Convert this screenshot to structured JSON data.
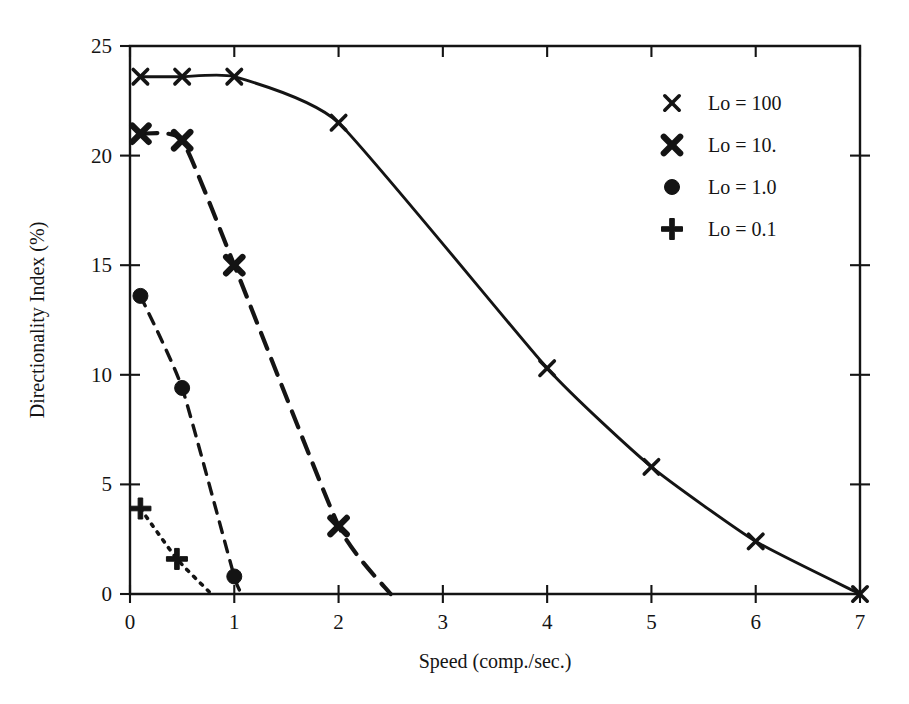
{
  "chart_data": {
    "type": "line",
    "title": "",
    "xlabel": "Speed (comp./sec.)",
    "ylabel": "Directionality Index (%)",
    "xlim": [
      0,
      7
    ],
    "ylim": [
      0,
      25
    ],
    "xticks": [
      "0",
      "1",
      "2",
      "3",
      "4",
      "5",
      "6",
      "7"
    ],
    "yticks": [
      "0",
      "5",
      "10",
      "15",
      "20",
      "25"
    ],
    "xtick_values": [
      0,
      1,
      2,
      3,
      4,
      5,
      6,
      7
    ],
    "ytick_values": [
      0,
      5,
      10,
      15,
      20,
      25
    ],
    "grid": false,
    "legend_position": "upper-right-inside",
    "frame": "box",
    "series": [
      {
        "name": "Lo = 100",
        "marker": "x-thin",
        "linestyle": "solid",
        "points": [
          {
            "x": 0.1,
            "y": 23.6
          },
          {
            "x": 0.5,
            "y": 23.6
          },
          {
            "x": 1.0,
            "y": 23.6
          },
          {
            "x": 2.0,
            "y": 21.5
          },
          {
            "x": 4.0,
            "y": 10.3
          },
          {
            "x": 5.0,
            "y": 5.8
          },
          {
            "x": 6.0,
            "y": 2.4
          },
          {
            "x": 7.0,
            "y": 0.0
          }
        ]
      },
      {
        "name": "Lo = 10.",
        "marker": "x-bold",
        "linestyle": "long-dash",
        "points": [
          {
            "x": 0.1,
            "y": 21.0
          },
          {
            "x": 0.5,
            "y": 20.7
          },
          {
            "x": 1.0,
            "y": 15.0
          },
          {
            "x": 2.0,
            "y": 3.1
          },
          {
            "x": 2.5,
            "y": 0.0
          }
        ]
      },
      {
        "name": "Lo = 1.0",
        "marker": "circle",
        "linestyle": "medium-dash",
        "points": [
          {
            "x": 0.1,
            "y": 13.6
          },
          {
            "x": 0.5,
            "y": 9.4
          },
          {
            "x": 1.0,
            "y": 0.8
          },
          {
            "x": 1.08,
            "y": 0.0
          }
        ]
      },
      {
        "name": "Lo = 0.1",
        "marker": "plus",
        "linestyle": "dotted",
        "points": [
          {
            "x": 0.1,
            "y": 3.9
          },
          {
            "x": 0.45,
            "y": 1.6
          },
          {
            "x": 0.78,
            "y": 0.0
          }
        ]
      }
    ]
  },
  "legend": {
    "entries": [
      {
        "label": "Lo = 100",
        "marker": "x-thin"
      },
      {
        "label": "Lo = 10.",
        "marker": "x-bold"
      },
      {
        "label": "Lo = 1.0",
        "marker": "circle"
      },
      {
        "label": "Lo = 0.1",
        "marker": "plus"
      }
    ]
  },
  "colors": {
    "ink": "#141414",
    "background": "#ffffff"
  }
}
